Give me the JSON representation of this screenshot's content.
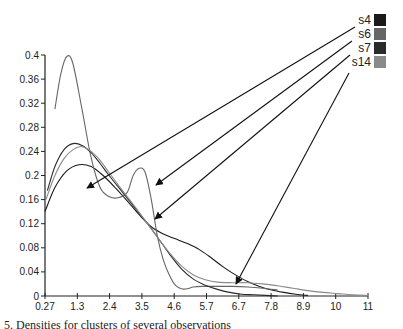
{
  "chart_data": {
    "type": "line",
    "title": "",
    "xlabel": "",
    "ylabel": "",
    "xlim": [
      0.27,
      11
    ],
    "ylim": [
      0,
      0.4
    ],
    "grid": false,
    "legend_position": "top-right",
    "x_ticks": [
      "0.27",
      "1.3",
      "2.4",
      "3.5",
      "4.6",
      "5.7",
      "6.7",
      "7.8",
      "8.9",
      "10",
      "11"
    ],
    "y_ticks": [
      "0",
      "0.04",
      "0.08",
      "0.12",
      "0.16",
      "0.2",
      "0.24",
      "0.28",
      "0.32",
      "0.36",
      "0.4"
    ],
    "series": [
      {
        "name": "s4",
        "color": "#1a1a1a",
        "x": [
          0.27,
          0.6,
          1.0,
          1.4,
          1.8,
          2.2,
          2.6,
          3.0,
          3.4,
          3.8,
          4.2,
          4.6,
          5.0,
          5.4,
          5.8,
          6.2,
          6.6,
          7.0,
          7.4,
          7.8,
          8.2,
          8.6,
          9.0
        ],
        "values": [
          0.14,
          0.18,
          0.208,
          0.218,
          0.215,
          0.2,
          0.18,
          0.158,
          0.135,
          0.115,
          0.103,
          0.095,
          0.087,
          0.077,
          0.063,
          0.048,
          0.035,
          0.024,
          0.016,
          0.01,
          0.006,
          0.003,
          0.001
        ]
      },
      {
        "name": "s6",
        "color": "#666666",
        "x": [
          0.6,
          0.8,
          1.0,
          1.2,
          1.5,
          1.8,
          2.1,
          2.4,
          2.7,
          3.0,
          3.2,
          3.4,
          3.6,
          3.8,
          4.0,
          4.2,
          4.4,
          4.6,
          4.8,
          5.0,
          5.2,
          5.5,
          6.0,
          6.5,
          7.0,
          7.5,
          8.0
        ],
        "values": [
          0.31,
          0.37,
          0.398,
          0.385,
          0.31,
          0.23,
          0.18,
          0.165,
          0.163,
          0.172,
          0.2,
          0.212,
          0.205,
          0.16,
          0.1,
          0.06,
          0.035,
          0.018,
          0.012,
          0.012,
          0.015,
          0.016,
          0.016,
          0.016,
          0.015,
          0.013,
          0.01
        ]
      },
      {
        "name": "s7",
        "color": "#2a2a2a",
        "x": [
          0.35,
          0.6,
          0.9,
          1.2,
          1.5,
          1.8,
          2.1,
          2.4,
          2.8,
          3.2,
          3.6,
          4.0,
          4.4,
          4.8,
          5.2,
          5.6,
          6.0,
          6.4,
          6.8,
          7.2,
          7.6,
          8.0
        ],
        "values": [
          0.175,
          0.215,
          0.243,
          0.253,
          0.25,
          0.238,
          0.22,
          0.2,
          0.175,
          0.15,
          0.125,
          0.098,
          0.07,
          0.045,
          0.028,
          0.018,
          0.011,
          0.006,
          0.003,
          0.002,
          0.001,
          0.0
        ]
      },
      {
        "name": "s14",
        "color": "#8a8a8a",
        "x": [
          0.3,
          0.6,
          0.9,
          1.2,
          1.5,
          1.8,
          2.1,
          2.4,
          2.8,
          3.2,
          3.6,
          4.0,
          4.4,
          4.8,
          5.2,
          5.6,
          6.0,
          6.5,
          7.0,
          7.5,
          8.0,
          8.5,
          9.0,
          9.5,
          10.0,
          10.5,
          11.0
        ],
        "values": [
          0.16,
          0.2,
          0.228,
          0.243,
          0.248,
          0.24,
          0.225,
          0.205,
          0.178,
          0.152,
          0.125,
          0.098,
          0.072,
          0.05,
          0.035,
          0.027,
          0.023,
          0.022,
          0.022,
          0.02,
          0.017,
          0.013,
          0.009,
          0.006,
          0.004,
          0.002,
          0.001
        ]
      }
    ],
    "annotations": [
      {
        "label": "s4",
        "arrow_from_px": [
          355,
          27
        ],
        "arrow_to_px": [
          87,
          188
        ]
      },
      {
        "label": "s6",
        "arrow_from_px": [
          352,
          41
        ],
        "arrow_to_px": [
          156,
          185
        ]
      },
      {
        "label": "s7",
        "arrow_from_px": [
          350,
          55
        ],
        "arrow_to_px": [
          155,
          219
        ]
      },
      {
        "label": "s14",
        "arrow_from_px": [
          349,
          73
        ],
        "arrow_to_px": [
          236,
          284
        ]
      }
    ]
  },
  "caption": "5. Densities for clusters of several observations"
}
